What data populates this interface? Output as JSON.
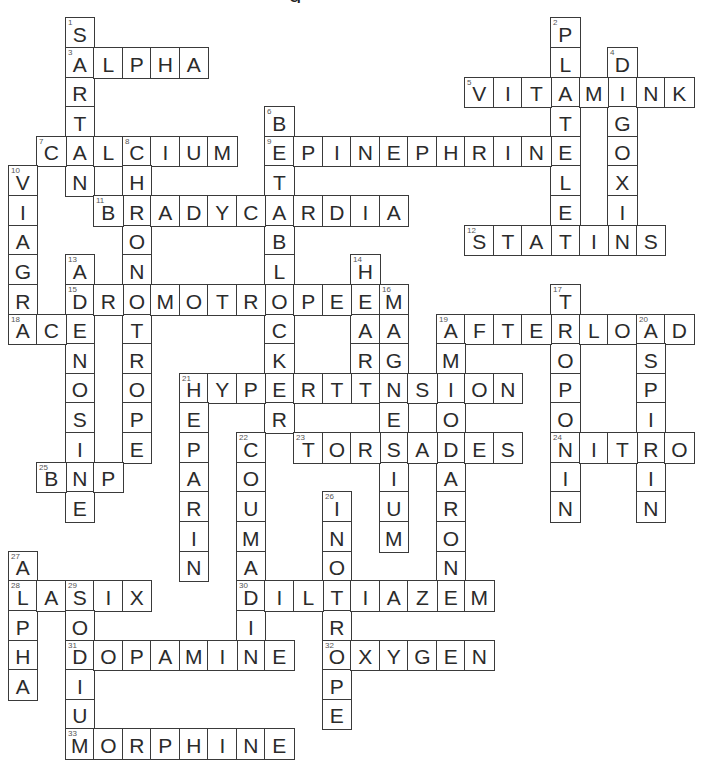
{
  "puzzle": {
    "title_fragment": "g",
    "grid": {
      "cols": 24,
      "rows": 25,
      "origin_x": 7.5,
      "origin_y": 17.3,
      "cell_w": 28.55,
      "cell_h": 29.63
    },
    "colors": {
      "border": "#3a3a3a",
      "letter": "#2b2b2b",
      "number": "#555555",
      "background": "#ffffff"
    },
    "words": [
      {
        "num": 1,
        "answer": "SARTAN",
        "dir": "down",
        "row": 0,
        "col": 2
      },
      {
        "num": 2,
        "answer": "PLATELET",
        "dir": "down",
        "row": 0,
        "col": 19
      },
      {
        "num": 3,
        "answer": "ALPHA",
        "dir": "across",
        "row": 1,
        "col": 2
      },
      {
        "num": 4,
        "answer": "DIGOXIN",
        "dir": "down",
        "row": 1,
        "col": 21
      },
      {
        "num": 5,
        "answer": "VITAMINK",
        "dir": "across",
        "row": 2,
        "col": 16
      },
      {
        "num": 6,
        "answer": "BETABLOCKER",
        "dir": "down",
        "row": 3,
        "col": 9
      },
      {
        "num": 7,
        "answer": "CALCIUM",
        "dir": "across",
        "row": 4,
        "col": 1
      },
      {
        "num": 8,
        "answer": "CHRONOTROPE",
        "dir": "down",
        "row": 4,
        "col": 4
      },
      {
        "num": 9,
        "answer": "EPINEPHRINE",
        "dir": "across",
        "row": 4,
        "col": 9
      },
      {
        "num": 10,
        "answer": "VIAGRA",
        "dir": "down",
        "row": 5,
        "col": 0
      },
      {
        "num": 11,
        "answer": "BRADYCARDIA",
        "dir": "across",
        "row": 6,
        "col": 3
      },
      {
        "num": 12,
        "answer": "STATINS",
        "dir": "across",
        "row": 7,
        "col": 16
      },
      {
        "num": 13,
        "answer": "ADENOSINE",
        "dir": "down",
        "row": 8,
        "col": 2
      },
      {
        "num": 14,
        "answer": "HEART",
        "dir": "down",
        "row": 8,
        "col": 12
      },
      {
        "num": 15,
        "answer": "DROMOTROPE",
        "dir": "across",
        "row": 9,
        "col": 2
      },
      {
        "num": 16,
        "answer": "MAGNESIUM",
        "dir": "down",
        "row": 9,
        "col": 13
      },
      {
        "num": 17,
        "answer": "TROPONIN",
        "dir": "down",
        "row": 9,
        "col": 19
      },
      {
        "num": 18,
        "answer": "ACE",
        "dir": "across",
        "row": 10,
        "col": 0
      },
      {
        "num": 19,
        "answer": "AFTERLOAD",
        "dir": "across",
        "row": 10,
        "col": 15
      },
      {
        "num": 19,
        "answer": "AMIODARONE",
        "dir": "down",
        "row": 10,
        "col": 15
      },
      {
        "num": 20,
        "answer": "ASPIRIN",
        "dir": "down",
        "row": 10,
        "col": 22
      },
      {
        "num": 21,
        "answer": "HYPERTENSION",
        "dir": "across",
        "row": 12,
        "col": 6
      },
      {
        "num": 21,
        "answer": "HEPARIN",
        "dir": "down",
        "row": 12,
        "col": 6
      },
      {
        "num": 22,
        "answer": "COUMADIN",
        "dir": "down",
        "row": 14,
        "col": 8
      },
      {
        "num": 23,
        "answer": "TORSADES",
        "dir": "across",
        "row": 14,
        "col": 10
      },
      {
        "num": 24,
        "answer": "NITRO",
        "dir": "across",
        "row": 14,
        "col": 19
      },
      {
        "num": 25,
        "answer": "BNP",
        "dir": "across",
        "row": 15,
        "col": 1
      },
      {
        "num": 26,
        "answer": "INOTROPE",
        "dir": "down",
        "row": 16,
        "col": 11
      },
      {
        "num": 27,
        "answer": "ALPHA",
        "dir": "down",
        "row": 18,
        "col": 0
      },
      {
        "num": 28,
        "answer": "LASIX",
        "dir": "across",
        "row": 19,
        "col": 0
      },
      {
        "num": 29,
        "answer": "SODIUM",
        "dir": "down",
        "row": 19,
        "col": 2
      },
      {
        "num": 30,
        "answer": "DILTIAZEM",
        "dir": "across",
        "row": 19,
        "col": 8
      },
      {
        "num": 31,
        "answer": "DOPAMINE",
        "dir": "across",
        "row": 21,
        "col": 2
      },
      {
        "num": 32,
        "answer": "OXYGEN",
        "dir": "across",
        "row": 21,
        "col": 11
      },
      {
        "num": 33,
        "answer": "MORPHINE",
        "dir": "across",
        "row": 24,
        "col": 2
      }
    ]
  }
}
